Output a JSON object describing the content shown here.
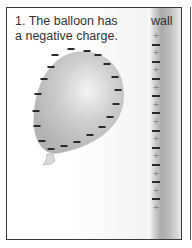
{
  "caption": {
    "line1": "1. The balloon has",
    "line2": "a negative charge."
  },
  "wall_label": "wall",
  "balloon": {
    "charge_sign": "−",
    "charge_count": 20,
    "color": "#c4c4c4"
  },
  "wall": {
    "pattern": [
      "+",
      "−",
      "+",
      "−",
      "+",
      "−",
      "+",
      "−",
      "+",
      "−",
      "+",
      "−",
      "+",
      "−",
      "+",
      "−",
      "+",
      "−",
      "+",
      "−",
      "+"
    ]
  },
  "colors": {
    "border": "#3a3a3a",
    "text": "#333333",
    "negative": "#2a2a2a",
    "positive": "#8a8a8a"
  }
}
